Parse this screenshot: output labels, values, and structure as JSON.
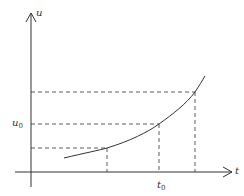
{
  "diagram": {
    "axes": {
      "y_label": "u",
      "x_label": "t"
    },
    "labels": {
      "u0_main": "u",
      "u0_sub": "0",
      "t0_main": "t",
      "t0_sub": "0"
    },
    "colors": {
      "stroke": "#333333",
      "background": "#ffffff"
    }
  }
}
